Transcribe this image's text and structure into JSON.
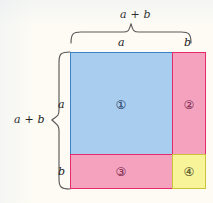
{
  "figure": {
    "background_color": "#fdfbf4"
  },
  "labels": {
    "top_total": "a + b",
    "top_a": "a",
    "top_b": "b",
    "left_total": "a + b",
    "left_a": "a",
    "left_b": "b"
  },
  "regions": [
    {
      "id": "1",
      "numeral": "①",
      "fill_color": "#a9cdee",
      "border_color": "#3d82c6",
      "width_label": "a",
      "height_label": "a"
    },
    {
      "id": "2",
      "numeral": "②",
      "fill_color": "#f5a2bf",
      "border_color": "#e52a6e",
      "width_label": "b",
      "height_label": "a"
    },
    {
      "id": "3",
      "numeral": "③",
      "fill_color": "#f5a2bf",
      "border_color": "#e52a6e",
      "width_label": "a",
      "height_label": "b"
    },
    {
      "id": "4",
      "numeral": "④",
      "fill_color": "#f7f49a",
      "border_color": "#cbc33a",
      "width_label": "b",
      "height_label": "b"
    }
  ],
  "braces": {
    "top_color": "#5a5a5a",
    "left_color": "#5a5a5a"
  }
}
